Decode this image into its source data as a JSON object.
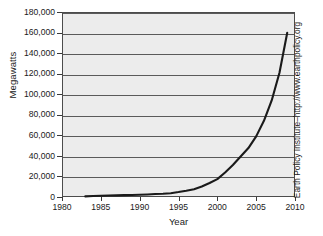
{
  "chart_data": {
    "type": "line",
    "title": "",
    "xlabel": "Year",
    "ylabel": "Megawatts",
    "xlim": [
      1980,
      2010
    ],
    "ylim": [
      0,
      180000
    ],
    "grid": true,
    "legend": null,
    "x_ticks": [
      "1980",
      "1985",
      "1990",
      "1995",
      "2000",
      "2005",
      "2010"
    ],
    "x_tick_values": [
      1980,
      1985,
      1990,
      1995,
      2000,
      2005,
      2010
    ],
    "y_ticks": [
      "0",
      "20,000",
      "40,000",
      "60,000",
      "80,000",
      "100,000",
      "120,000",
      "140,000",
      "160,000",
      "180,000"
    ],
    "y_tick_values": [
      0,
      20000,
      40000,
      60000,
      80000,
      100000,
      120000,
      140000,
      160000,
      180000
    ],
    "series": [
      {
        "name": "World Wind Electric Generating Capacity",
        "x": [
          1983,
          1984,
          1985,
          1986,
          1987,
          1988,
          1989,
          1990,
          1991,
          1992,
          1993,
          1994,
          1995,
          1996,
          1997,
          1998,
          1999,
          2000,
          2001,
          2002,
          2003,
          2004,
          2005,
          2006,
          2007,
          2008,
          2009
        ],
        "values": [
          600,
          900,
          1200,
          1500,
          1600,
          1800,
          2000,
          2200,
          2500,
          2900,
          3100,
          3700,
          4800,
          6100,
          7600,
          10200,
          13600,
          17400,
          23900,
          31100,
          39400,
          47600,
          59000,
          74100,
          93900,
          120900,
          159800
        ]
      }
    ]
  },
  "axes": {
    "y_title": "Megawatts",
    "x_title": "Year"
  },
  "credit": {
    "text": "Earth Policy Institute–http://www.earthpolicy.org"
  },
  "colors": {
    "plot_background": "#ececec",
    "gridline": "#5a5a5a",
    "axis": "#4c4c4c",
    "curve": "#1a1a1a",
    "text": "#1a1a1a"
  }
}
